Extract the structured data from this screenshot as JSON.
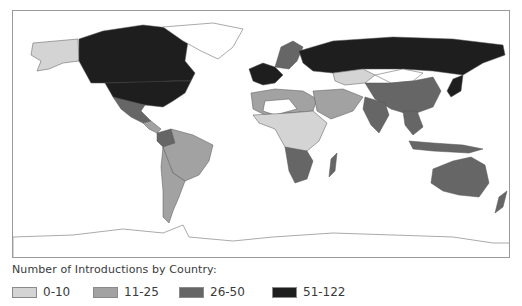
{
  "legend": {
    "title": "Number of Introductions by Country:",
    "items": [
      {
        "label": "0-10",
        "color": "#d4d4d4"
      },
      {
        "label": "11-25",
        "color": "#a2a2a2"
      },
      {
        "label": "26-50",
        "color": "#666666"
      },
      {
        "label": "51-122",
        "color": "#1e1e1e"
      }
    ]
  },
  "map": {
    "frame_color": "#9a9a9a",
    "background": "#ffffff",
    "no_data_color": "#ffffff",
    "regions": [
      {
        "name": "Alaska",
        "class": "0-10"
      },
      {
        "name": "Canada",
        "class": "51-122"
      },
      {
        "name": "United States",
        "class": "51-122"
      },
      {
        "name": "Greenland",
        "class": "none"
      },
      {
        "name": "Mexico",
        "class": "26-50"
      },
      {
        "name": "Central America",
        "class": "11-25"
      },
      {
        "name": "Colombia",
        "class": "26-50"
      },
      {
        "name": "Brazil",
        "class": "11-25"
      },
      {
        "name": "Argentina",
        "class": "11-25"
      },
      {
        "name": "Western Europe",
        "class": "51-122"
      },
      {
        "name": "Scandinavia",
        "class": "26-50"
      },
      {
        "name": "Russia",
        "class": "51-122"
      },
      {
        "name": "Kazakhstan",
        "class": "0-10"
      },
      {
        "name": "Mongolia",
        "class": "none"
      },
      {
        "name": "China",
        "class": "26-50"
      },
      {
        "name": "India",
        "class": "26-50"
      },
      {
        "name": "Japan",
        "class": "51-122"
      },
      {
        "name": "North Africa",
        "class": "11-25"
      },
      {
        "name": "Sahara",
        "class": "none"
      },
      {
        "name": "Central Africa",
        "class": "0-10"
      },
      {
        "name": "Southern Africa",
        "class": "26-50"
      },
      {
        "name": "Madagascar",
        "class": "26-50"
      },
      {
        "name": "Middle East",
        "class": "11-25"
      },
      {
        "name": "Southeast Asia",
        "class": "26-50"
      },
      {
        "name": "Indonesia",
        "class": "26-50"
      },
      {
        "name": "Australia",
        "class": "26-50"
      },
      {
        "name": "New Zealand",
        "class": "26-50"
      },
      {
        "name": "Antarctica",
        "class": "none"
      }
    ]
  }
}
